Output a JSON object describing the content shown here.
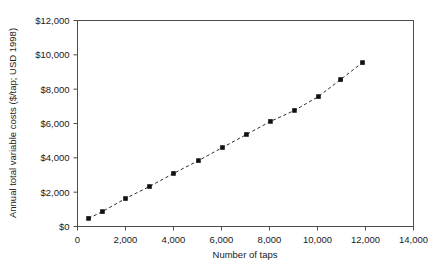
{
  "chart_data": {
    "type": "line",
    "title": "",
    "subtitle": "",
    "xlabel": "Number of taps",
    "ylabel": "Annual total variable costs ($/tap; USD 1998)",
    "xlim": [
      0,
      14000
    ],
    "ylim": [
      0,
      12000
    ],
    "grid": false,
    "legend": "none",
    "xticks": [
      0,
      2000,
      4000,
      6000,
      8000,
      10000,
      12000,
      14000
    ],
    "xticklabels": [
      "0",
      "2,000",
      "4,000",
      "6,000",
      "8,000",
      "10,000",
      "12,000",
      "14,000"
    ],
    "yticks": [
      0,
      2000,
      4000,
      6000,
      8000,
      10000,
      12000
    ],
    "yticklabels": [
      "$0",
      "$2,000",
      "$4,000",
      "$6,000",
      "$8,000",
      "$10,000",
      "$12,000"
    ],
    "marker": "square",
    "linestyle": "dashed",
    "series": [
      {
        "name": "Annual total variable costs",
        "x": [
          460,
          1040,
          2000,
          3000,
          4000,
          5040,
          6040,
          7040,
          8040,
          9040,
          10040,
          10960,
          11875
        ],
        "y": [
          470,
          870,
          1630,
          2330,
          3090,
          3840,
          4600,
          5360,
          6120,
          6760,
          7570,
          8560,
          9550
        ]
      }
    ],
    "annotations": []
  },
  "axis": {
    "x_label": "Number of taps",
    "y_label": "Annual total variable costs ($/tap; USD 1998)"
  }
}
